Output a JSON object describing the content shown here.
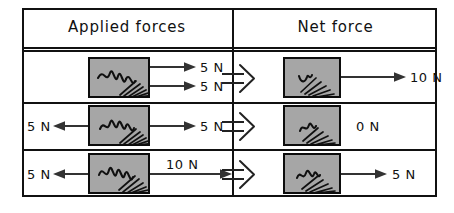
{
  "figure": {
    "colors": {
      "ink": "#111111",
      "block_fill": "#a6a6a6",
      "block_border": "#0d0d0d",
      "arrow": "#333333",
      "background": "#ffffff"
    }
  },
  "table": {
    "headers": {
      "applied": "Applied forces",
      "net": "Net force"
    },
    "rows": [
      {
        "id": "row-1",
        "applied": {
          "forces": [
            {
              "label": "5 N",
              "direction": "right",
              "magnitude": 5,
              "unit": "N"
            },
            {
              "label": "5 N",
              "direction": "right",
              "magnitude": 5,
              "unit": "N"
            }
          ]
        },
        "net": {
          "label": "10 N",
          "direction": "right",
          "magnitude": 10,
          "unit": "N",
          "has_arrow": true
        }
      },
      {
        "id": "row-2",
        "applied": {
          "forces": [
            {
              "label": "5 N",
              "direction": "left",
              "magnitude": 5,
              "unit": "N"
            },
            {
              "label": "5 N",
              "direction": "right",
              "magnitude": 5,
              "unit": "N"
            }
          ]
        },
        "net": {
          "label": "0 N",
          "direction": "none",
          "magnitude": 0,
          "unit": "N",
          "has_arrow": false
        }
      },
      {
        "id": "row-3",
        "applied": {
          "forces": [
            {
              "label": "5 N",
              "direction": "left",
              "magnitude": 5,
              "unit": "N"
            },
            {
              "label": "10 N",
              "direction": "right",
              "magnitude": 10,
              "unit": "N"
            }
          ]
        },
        "net": {
          "label": "5 N",
          "direction": "right",
          "magnitude": 5,
          "unit": "N",
          "has_arrow": true
        }
      }
    ],
    "implies_symbol": "⟹"
  }
}
